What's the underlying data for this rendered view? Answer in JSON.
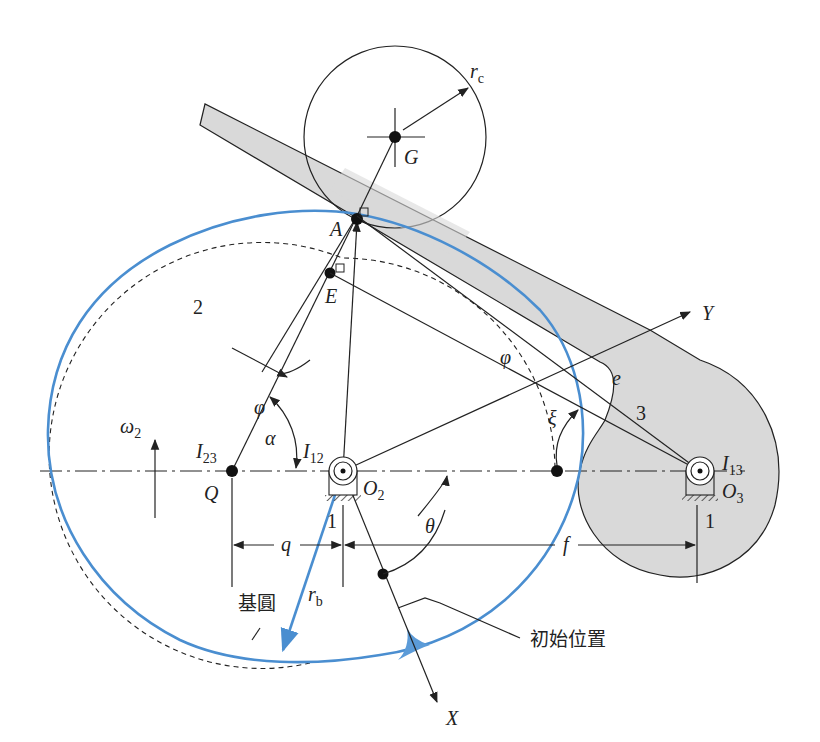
{
  "figure": {
    "type": "cam mechanism with oscillating roller follower",
    "colors": {
      "cam_profile": "#4a8ed0",
      "follower_fill": "#d9d9d9",
      "ink": "#222222",
      "cusp_fill": "#5b9bd8"
    },
    "links": {
      "cam": "2",
      "follower": "3",
      "frame_cam": "1",
      "frame_follower": "1"
    },
    "points": {
      "A": "A",
      "E": "E",
      "G": "G",
      "Q": "Q",
      "O2": "O",
      "O2_sub": "2",
      "O3": "O",
      "O3_sub": "3",
      "I12": "I",
      "I12_sub": "12",
      "I13": "I",
      "I13_sub": "13",
      "I23": "I",
      "I23_sub": "23"
    },
    "dimensions": {
      "rc": "r",
      "rc_sub": "c",
      "rb": "r",
      "rb_sub": "b",
      "q": "q",
      "f": "f",
      "e": "e"
    },
    "angles": {
      "phi": "φ",
      "alpha": "α",
      "xi": "ξ",
      "theta": "θ",
      "omega": "ω",
      "omega_sub": "2"
    },
    "axes": {
      "x": "X",
      "y": "Y"
    },
    "annotations": {
      "base_circle": "基圓",
      "initial_position": "初始位置"
    }
  }
}
